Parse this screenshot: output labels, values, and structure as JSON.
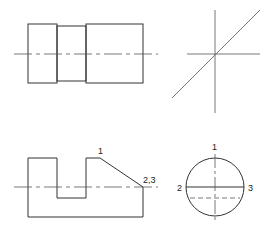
{
  "diagram": {
    "colors": {
      "line": "#333333",
      "center": "#555555",
      "bg": "#ffffff"
    },
    "views": {
      "front_top": {
        "name": "front-view-cylinder-stepped"
      },
      "side_top": {
        "name": "projection-construction-lines"
      },
      "front_bottom": {
        "name": "front-view-with-slot-and-chamfer",
        "labels": [
          "1",
          "2,3"
        ]
      },
      "side_bottom": {
        "name": "circle-side-view",
        "labels": [
          "1",
          "2",
          "3"
        ]
      }
    }
  }
}
